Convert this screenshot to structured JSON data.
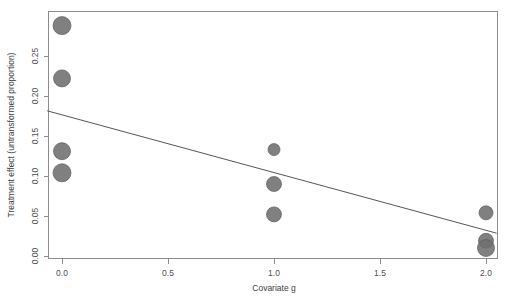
{
  "chart_data": {
    "type": "scatter",
    "title": "",
    "subtitle": "",
    "xlabel": "Covariate g",
    "ylabel": "Treatment effect (untransformed proportion)",
    "xlim": [
      -0.07,
      2.05
    ],
    "ylim": [
      -0.005,
      0.295
    ],
    "grid": false,
    "legend": null,
    "xticks": [
      0.0,
      0.5,
      1.0,
      1.5,
      2.0
    ],
    "xticklabels": [
      "0.0",
      "0.5",
      "1.0",
      "1.5",
      "2.0"
    ],
    "yticks": [
      0.0,
      0.05,
      0.1,
      0.15,
      0.2,
      0.25
    ],
    "yticklabels": [
      "0.00",
      "0.05",
      "0.10",
      "0.15",
      "0.20",
      "0.25"
    ],
    "marker": "filled-circle",
    "marker_color": "#6e6e6e",
    "points": [
      {
        "x": 0.0,
        "y": 0.288,
        "size": 9.0
      },
      {
        "x": 0.0,
        "y": 0.222,
        "size": 8.5
      },
      {
        "x": 0.0,
        "y": 0.131,
        "size": 8.5
      },
      {
        "x": 0.0,
        "y": 0.104,
        "size": 9.0
      },
      {
        "x": 1.0,
        "y": 0.133,
        "size": 6.0
      },
      {
        "x": 1.0,
        "y": 0.09,
        "size": 7.5
      },
      {
        "x": 1.0,
        "y": 0.052,
        "size": 7.5
      },
      {
        "x": 2.0,
        "y": 0.054,
        "size": 7.0
      },
      {
        "x": 2.0,
        "y": 0.019,
        "size": 7.5
      },
      {
        "x": 2.0,
        "y": 0.01,
        "size": 8.5
      }
    ],
    "regression_line": {
      "name": "fitted-regression",
      "x_start": -0.07,
      "y_start": 0.1815,
      "x_end": 2.05,
      "y_end": 0.0285,
      "color": "#555555"
    }
  }
}
